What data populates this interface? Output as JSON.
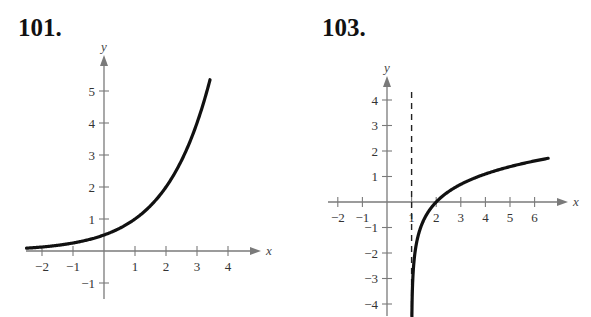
{
  "header_fragment": "...",
  "problems": [
    {
      "number": "101.",
      "title": ""
    },
    {
      "number": "103.",
      "title": ""
    }
  ],
  "chart_data": [
    {
      "type": "line",
      "title": "101.",
      "xlabel": "x",
      "ylabel": "y",
      "xlim": [
        -2.5,
        4.8
      ],
      "ylim": [
        -1.5,
        6.0
      ],
      "x_ticks": [
        -2,
        -1,
        1,
        2,
        3,
        4
      ],
      "y_ticks": [
        -1,
        1,
        2,
        3,
        4,
        5
      ],
      "grid": false,
      "series": [
        {
          "name": "y = 2^(x-1)",
          "x": [
            -2.5,
            -2,
            -1,
            0,
            1,
            2,
            3,
            3.4
          ],
          "values": [
            0.09,
            0.125,
            0.25,
            0.5,
            1,
            2,
            4,
            5.28
          ]
        }
      ]
    },
    {
      "type": "line",
      "title": "103.",
      "xlabel": "x",
      "ylabel": "y",
      "xlim": [
        -2.5,
        7.5
      ],
      "ylim": [
        -4.5,
        4.8
      ],
      "x_ticks": [
        -2,
        -1,
        1,
        2,
        3,
        4,
        5,
        6
      ],
      "y_ticks": [
        -4,
        -3,
        -2,
        -1,
        1,
        2,
        3,
        4
      ],
      "grid": false,
      "asymptote": {
        "type": "vertical",
        "x": 1,
        "style": "dashed"
      },
      "series": [
        {
          "name": "y = ln(x-1)",
          "x": [
            1.01,
            1.05,
            1.2,
            1.5,
            2,
            3,
            4,
            5,
            6,
            6.5
          ],
          "values": [
            -4.6,
            -3.0,
            -1.61,
            -0.69,
            0,
            0.69,
            1.1,
            1.39,
            1.61,
            1.7
          ]
        }
      ]
    }
  ]
}
